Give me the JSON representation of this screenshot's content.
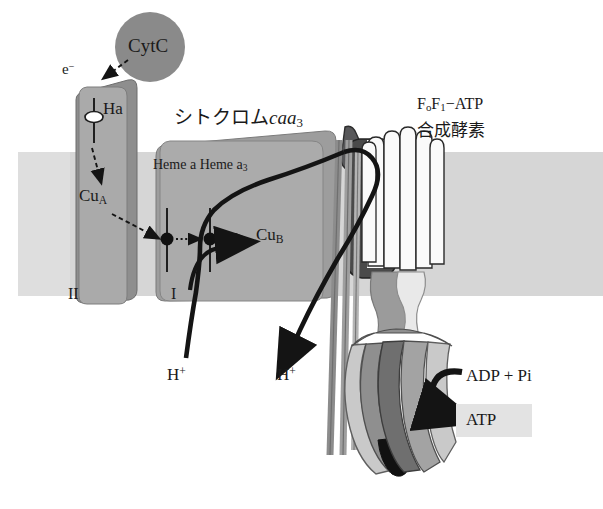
{
  "figure": {
    "type": "biochemistry-diagram",
    "background_color": "#ffffff"
  },
  "membrane": {
    "name": "lipid-bilayer-band",
    "color": "#d6d6d6",
    "top_y": 152,
    "bottom_y": 296
  },
  "labels": {
    "cytc": "CytC",
    "electron": "e",
    "electron_charge": "−",
    "heme_a_subunit2": "Ha",
    "cu_a": "Cu",
    "cu_a_sub": "A",
    "subunit_2": "II",
    "cytochrome_caa3_prefix": "シトクロム",
    "cytochrome_caa3_italic": "caa",
    "cytochrome_caa3_sub": "3",
    "heme_a": "Heme a",
    "heme_a3": "Heme a",
    "heme_a3_sub": "3",
    "cu_b": "Cu",
    "cu_b_sub": "B",
    "subunit_1": "I",
    "atp_synthase_line1_f": "F",
    "atp_synthase_line1_f_sub": "o",
    "atp_synthase_line1_f2": "F",
    "atp_synthase_line1_f2_sub": "1",
    "atp_synthase_line1_tail": "−ATP",
    "atp_synthase_line2": "合成酵素",
    "proton_in": "H",
    "proton_in_charge": "+",
    "proton_out": "H",
    "proton_out_charge": "+",
    "substrate": "ADP + Pi",
    "product": "ATP"
  },
  "colors": {
    "membrane": "#d6d6d6",
    "cytc_circle": "#8a8a8a",
    "subunit_ii": "#a9a9a9",
    "subunit_ii_side": "#8e8e8e",
    "subunit_i": "#ababab",
    "subunit_i_inner": "#a0a0a0",
    "f0_dark": "#4a4a4a",
    "f0_cap": "#5c5c5c",
    "c_ring_white": "#fafafa",
    "stalk_mid": "#9b9b9b",
    "stalk_light": "#e6e6e6",
    "f1_light": "#c9c9c9",
    "f1_mid": "#a3a3a3",
    "f1_dark": "#6f6f6f",
    "f1_black": "#111111",
    "outline": "#2a2a2a",
    "arrow_black": "#141414",
    "atp_highlight": "#e3e3e3",
    "text": "#1a1a1a"
  },
  "components": [
    {
      "name": "cytochrome-c",
      "label": "CytC",
      "shape": "circle",
      "cx": 150,
      "cy": 47,
      "r": 35
    },
    {
      "name": "subunit-II",
      "label": "II",
      "shape": "rounded-rect",
      "x": 72,
      "y": 88,
      "w": 60,
      "h": 215
    },
    {
      "name": "subunit-I",
      "label": "I",
      "shape": "rounded-rect",
      "x": 152,
      "y": 140,
      "w": 185,
      "h": 163
    },
    {
      "name": "fo-sector",
      "label": "Fo",
      "shape": "oval-and-cylinders"
    },
    {
      "name": "c-ring",
      "label": "c-ring",
      "shape": "cylinder-bundle"
    },
    {
      "name": "f1-head",
      "label": "F1",
      "shape": "petal-lobes"
    }
  ],
  "arrows": [
    {
      "name": "electron-transfer-cytc-to-heme-a",
      "style": "dashed",
      "from": "CytC",
      "to": "Ha"
    },
    {
      "name": "electron-transfer-ha-to-cua",
      "style": "dashed",
      "from": "Ha",
      "to": "CuA"
    },
    {
      "name": "electron-transfer-cua-to-heme-a",
      "style": "dashed",
      "from": "CuA",
      "to": "Heme a"
    },
    {
      "name": "electron-transfer-heme-a-to-heme-a3",
      "style": "dotted",
      "from": "Heme a",
      "to": "Heme a3"
    },
    {
      "name": "electron-transfer-heme-a3-to-cub",
      "style": "dotted",
      "from": "Heme a3",
      "to": "CuB"
    },
    {
      "name": "proton-pump-path",
      "style": "thick-solid",
      "from": "H+ (inside)",
      "to": "H+ (outside)"
    },
    {
      "name": "atp-synthesis-arrow",
      "style": "thick-curved",
      "from": "ADP + Pi",
      "to": "ATP"
    }
  ]
}
